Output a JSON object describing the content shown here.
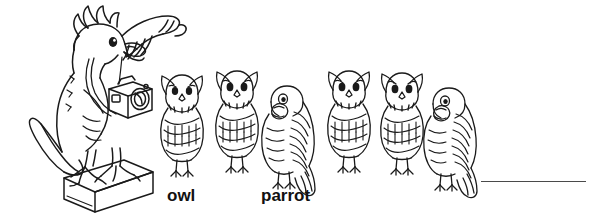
{
  "worksheet": {
    "background_color": "#ffffff",
    "ink_color": "#1a1a1a",
    "blank_line_color": "#4a4a4a"
  },
  "mascot": {
    "name": "cockatoo-photographer",
    "description": "large cartoon cockatoo with crest, raised wing, camera on neck strap, standing on a box pedestal",
    "accessories": [
      "camera",
      "neck-strap",
      "pedestal-box"
    ]
  },
  "labels": {
    "owl": "owl",
    "parrot": "parrot"
  },
  "bird_row": {
    "count": 6,
    "items": [
      {
        "index": 1,
        "kind": "owl",
        "x": 158,
        "label": "owl"
      },
      {
        "index": 2,
        "kind": "owl",
        "x": 213,
        "label": "owl"
      },
      {
        "index": 3,
        "kind": "parrot",
        "x": 261,
        "label": "parrot"
      },
      {
        "index": 4,
        "kind": "owl",
        "x": 325,
        "label": "owl"
      },
      {
        "index": 5,
        "kind": "owl",
        "x": 378,
        "label": "owl"
      },
      {
        "index": 6,
        "kind": "parrot",
        "x": 423,
        "label": "parrot"
      }
    ]
  },
  "answer": {
    "blank_line": "",
    "x": 481,
    "y": 181,
    "width": 105
  }
}
